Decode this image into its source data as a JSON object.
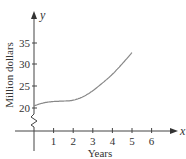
{
  "chart_data": {
    "type": "line",
    "title": "",
    "xlabel": "Years",
    "ylabel": "Million dollars",
    "x_axis_var": "x",
    "y_axis_var": "y",
    "x_ticks": [
      "1",
      "2",
      "3",
      "4",
      "5",
      "6"
    ],
    "y_ticks": [
      "20",
      "25",
      "30",
      "35"
    ],
    "xlim": [
      0,
      7
    ],
    "ylim": [
      20,
      37
    ],
    "y_axis_break": true,
    "grid": false,
    "series": [
      {
        "name": "curve",
        "x": [
          0,
          0.5,
          1,
          1.5,
          2,
          2.5,
          3,
          3.5,
          4,
          4.5,
          5
        ],
        "y": [
          20.5,
          21.2,
          21.5,
          21.6,
          21.8,
          22.6,
          24.0,
          25.8,
          27.8,
          30.2,
          32.8
        ]
      }
    ],
    "line_color": "#888888"
  }
}
